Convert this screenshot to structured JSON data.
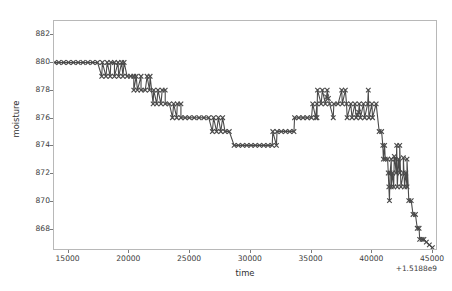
{
  "chart_data": {
    "type": "line",
    "title": "",
    "xlabel": "time",
    "ylabel": "moisture",
    "x_offset_label": "+1.5188e9",
    "grid": false,
    "legend": null,
    "marker": "x",
    "line_color": "#4a4a4a",
    "marker_color": "#4a4a4a",
    "xlim": [
      13800,
      45400
    ],
    "ylim": [
      866.5,
      883.0
    ],
    "xticks": [
      15000,
      20000,
      25000,
      30000,
      35000,
      40000,
      45000
    ],
    "xtick_labels": [
      "15000",
      "20000",
      "25000",
      "30000",
      "35000",
      "40000",
      "45000"
    ],
    "yticks": [
      882,
      880,
      878,
      876,
      874,
      872,
      870,
      868
    ],
    "ytick_labels": [
      "882",
      "880",
      "878",
      "876",
      "874",
      "872",
      "870",
      "868"
    ],
    "series": [
      {
        "name": "moisture",
        "x": [
          13850,
          14200,
          14600,
          15000,
          15400,
          15800,
          16200,
          16600,
          17000,
          17400,
          17800,
          18200,
          18500,
          18800,
          19100,
          19400,
          19600,
          17750,
          18100,
          18450,
          18800,
          19150,
          19500,
          19850,
          20150,
          20400,
          20600,
          21000,
          21500,
          21750,
          20400,
          20700,
          21000,
          21350,
          21700,
          22050,
          22400,
          22750,
          23000,
          22000,
          22300,
          22650,
          23000,
          23350,
          23700,
          24000,
          24300,
          23600,
          23950,
          24300,
          24650,
          25000,
          25400,
          25800,
          26200,
          26600,
          27000,
          27400,
          27750,
          26900,
          27250,
          27600,
          27950,
          28300,
          28700,
          29050,
          29400,
          29750,
          30100,
          30450,
          30800,
          31150,
          31500,
          31850,
          32200,
          31900,
          32250,
          32600,
          32950,
          33300,
          33650,
          33700,
          34050,
          34400,
          34750,
          35100,
          35450,
          35200,
          35550,
          35900,
          36250,
          36600,
          36950,
          37300,
          37650,
          38000,
          38350,
          38700,
          39050,
          39400,
          39750,
          40100,
          40450,
          35600,
          36000,
          36400,
          37600,
          37900,
          39800,
          36350,
          36500,
          38900,
          39000,
          35550,
          36900,
          38050,
          38450,
          38800,
          39150,
          39500,
          39850,
          40150,
          40700,
          40900,
          41000,
          41150,
          41050,
          41200,
          41400,
          41700,
          42000,
          42300,
          41450,
          41600,
          41800,
          42100,
          42400,
          42700,
          42900,
          41500,
          41700,
          41900,
          42200,
          42500,
          42800,
          43000,
          42150,
          42400,
          41550,
          41950,
          42700,
          43000,
          43150,
          43350,
          43500,
          43700,
          43850,
          44000,
          44050,
          44250,
          44400,
          44600,
          44850,
          45100
        ],
        "y": [
          880.0,
          880.0,
          880.0,
          880.0,
          880.0,
          880.0,
          880.0,
          880.0,
          880.0,
          880.0,
          880.0,
          880.0,
          880.0,
          880.0,
          880.0,
          880.0,
          880.0,
          879.0,
          879.0,
          879.0,
          879.0,
          879.0,
          879.0,
          879.0,
          879.0,
          879.0,
          879.0,
          879.0,
          879.0,
          879.0,
          878.0,
          878.0,
          878.0,
          878.0,
          878.0,
          878.0,
          878.0,
          878.0,
          878.0,
          877.0,
          877.0,
          877.0,
          877.0,
          877.0,
          877.0,
          877.0,
          877.0,
          876.0,
          876.0,
          876.0,
          876.0,
          876.0,
          876.0,
          876.0,
          876.0,
          876.0,
          876.0,
          876.0,
          876.0,
          875.0,
          875.0,
          875.0,
          875.0,
          875.0,
          874.0,
          874.0,
          874.0,
          874.0,
          874.0,
          874.0,
          874.0,
          874.0,
          874.0,
          874.0,
          874.0,
          875.0,
          875.0,
          875.0,
          875.0,
          875.0,
          875.0,
          876.0,
          876.0,
          876.0,
          876.0,
          876.0,
          876.0,
          877.0,
          877.0,
          877.0,
          877.0,
          877.0,
          877.0,
          877.0,
          877.0,
          877.0,
          877.0,
          877.0,
          877.0,
          877.0,
          877.0,
          877.0,
          877.0,
          878.0,
          878.0,
          878.0,
          878.0,
          878.0,
          878.0,
          877.5,
          877.4,
          876.2,
          876.4,
          876.0,
          876.0,
          876.0,
          876.0,
          876.0,
          876.0,
          876.0,
          876.0,
          876.0,
          875.0,
          875.0,
          874.0,
          874.0,
          873.0,
          873.0,
          873.0,
          873.0,
          873.0,
          873.0,
          872.0,
          872.0,
          872.0,
          872.0,
          872.0,
          872.0,
          872.0,
          871.0,
          871.0,
          871.0,
          871.0,
          871.0,
          871.0,
          871.0,
          874.0,
          874.0,
          870.0,
          873.2,
          873.1,
          873.0,
          870.0,
          870.0,
          869.0,
          869.0,
          868.0,
          868.0,
          867.2,
          867.2,
          867.2,
          867.0,
          866.8,
          866.6
        ]
      }
    ],
    "annotations": [
      {
        "text": "outlier markers at 878 near 35600-39800"
      },
      {
        "text": "outlier markers at 874 near 42150-42400"
      },
      {
        "text": "outlier marker at 870 near 41550"
      }
    ]
  }
}
